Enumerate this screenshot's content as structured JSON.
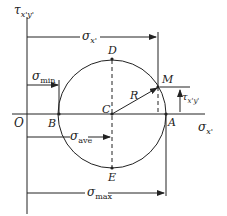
{
  "diagram": {
    "axes": {
      "vertical": "τ",
      "vertical_sub": "x'y'",
      "horizontal": "σ",
      "horizontal_sub": "x'",
      "origin": "O"
    },
    "points": {
      "A": "A",
      "B": "B",
      "C": "C",
      "D": "D",
      "E": "E",
      "M": "M"
    },
    "radius_label": "R",
    "dimensions": {
      "sigma_x": {
        "sym": "σ",
        "sub": "x'"
      },
      "sigma_min": {
        "sym": "σ",
        "sub": "min"
      },
      "sigma_ave": {
        "sym": "σ",
        "sub": "ave"
      },
      "sigma_max": {
        "sym": "σ",
        "sub": "max"
      },
      "tau_xy": {
        "sym": "τ",
        "sub": "x'y'"
      }
    }
  }
}
